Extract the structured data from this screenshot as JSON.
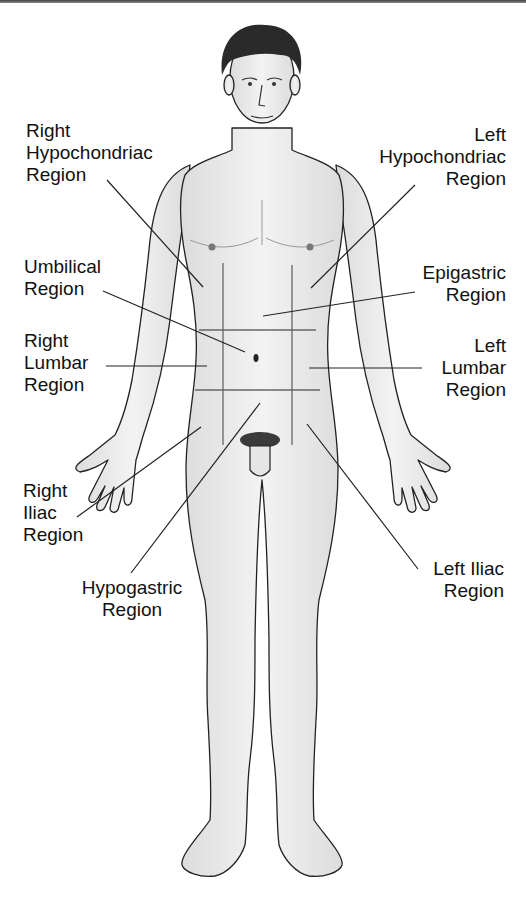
{
  "colors": {
    "skin": "#ededed",
    "outline": "#222222",
    "grid": "#666666",
    "leader": "#222222",
    "hair": "#2a2a2a"
  },
  "labels": {
    "right_hypochondriac": {
      "line1": "Right",
      "line2": "Hypochondriac",
      "line3": "Region"
    },
    "left_hypochondriac": {
      "line1": "Left",
      "line2": "Hypochondriac",
      "line3": "Region"
    },
    "umbilical": {
      "line1": "Umbilical",
      "line2": "Region"
    },
    "epigastric": {
      "line1": "Epigastric",
      "line2": "Region"
    },
    "right_lumbar": {
      "line1": "Right",
      "line2": "Lumbar",
      "line3": "Region"
    },
    "left_lumbar": {
      "line1": "Left",
      "line2": "Lumbar",
      "line3": "Region"
    },
    "right_iliac": {
      "line1": "Right",
      "line2": "Iliac",
      "line3": "Region"
    },
    "hypogastric": {
      "line1": "Hypogastric",
      "line2": "Region"
    },
    "left_iliac": {
      "line1": "Left Iliac",
      "line2": "Region"
    }
  }
}
